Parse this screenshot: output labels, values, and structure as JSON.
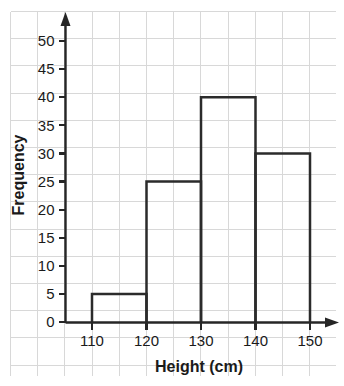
{
  "chart_data": {
    "type": "bar",
    "subtype": "histogram",
    "title": "",
    "xlabel": "Height (cm)",
    "ylabel": "Frequency",
    "categories": [
      "110–120",
      "120–130",
      "130–140",
      "140–150"
    ],
    "bin_edges": [
      110,
      120,
      130,
      140,
      150
    ],
    "values": [
      5,
      25,
      40,
      30
    ],
    "bars": [
      {
        "label": "110–120",
        "start": 110,
        "end": 120,
        "value": 5
      },
      {
        "label": "120–130",
        "start": 120,
        "end": 130,
        "value": 25
      },
      {
        "label": "130–140",
        "start": 130,
        "end": 140,
        "value": 40
      },
      {
        "label": "140–150",
        "start": 140,
        "end": 150,
        "value": 30
      }
    ],
    "xlim": [
      105,
      155
    ],
    "ylim": [
      0,
      52
    ],
    "xticks": [
      110,
      120,
      130,
      140,
      150
    ],
    "xtick_labels": [
      "110",
      "120",
      "130",
      "140",
      "150"
    ],
    "yticks": [
      0,
      5,
      10,
      15,
      20,
      25,
      30,
      35,
      40,
      45,
      50
    ],
    "ytick_labels": [
      "0",
      "5",
      "10",
      "15",
      "20",
      "25",
      "30",
      "35",
      "40",
      "45",
      "50"
    ],
    "grid": true,
    "legend": false,
    "bar_fill": "none",
    "bar_stroke": "#2b2b2b",
    "grid_color": "#d8d8d8",
    "axis_color": "#262626",
    "background": "#ffffff"
  },
  "axes": {
    "y_title": "Frequency",
    "x_title": "Height (cm)"
  }
}
